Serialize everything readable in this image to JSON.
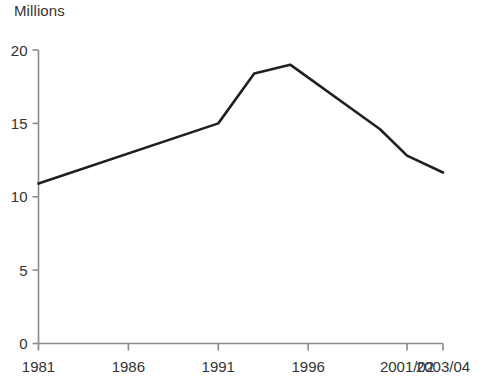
{
  "chart_data": {
    "type": "line",
    "title": "",
    "subtitle": "",
    "unit_label": "Millions",
    "xlabel": "",
    "ylabel": "Millions",
    "ylim": [
      0,
      20
    ],
    "yticks": [
      0,
      5,
      10,
      15,
      20
    ],
    "ytick_labels": [
      "0",
      "5",
      "10",
      "15",
      "20"
    ],
    "xtick_labels": [
      "1981",
      "1986",
      "1991",
      "1996",
      "2001/02",
      "2003/04"
    ],
    "xtick_positions": [
      1981,
      1986,
      1991,
      1996,
      2001.5,
      2003.5
    ],
    "xlim": [
      1981,
      2003.5
    ],
    "grid": false,
    "legend": false,
    "legend_position": "none",
    "series": [
      {
        "name": "Millions",
        "color": "#231f1f",
        "x": [
          1981,
          1991,
          1993,
          1995,
          2000,
          2001.5,
          2003.5
        ],
        "values": [
          10.9,
          15.0,
          18.4,
          19.0,
          14.6,
          12.8,
          11.65
        ],
        "points": [
          {
            "x": 1981,
            "label": "1981",
            "y": 10.9
          },
          {
            "x": 1991,
            "label": "1991",
            "y": 15.0
          },
          {
            "x": 1993,
            "label": "1993",
            "y": 18.4
          },
          {
            "x": 1995,
            "label": "1995",
            "y": 19.0
          },
          {
            "x": 2000,
            "label": "2000",
            "y": 14.6
          },
          {
            "x": 2001.5,
            "label": "2001/02",
            "y": 12.8
          },
          {
            "x": 2003.5,
            "label": "2003/04",
            "y": 11.65
          }
        ]
      }
    ],
    "colors": {
      "line": "#231f1f",
      "axis": "#8a8a8a",
      "text": "#333333",
      "background": "#ffffff"
    }
  }
}
